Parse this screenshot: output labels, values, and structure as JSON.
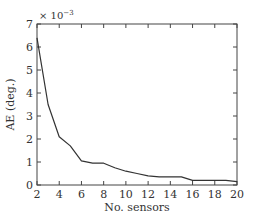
{
  "chart_data": {
    "type": "line",
    "title": "",
    "xlabel": "No. sensors",
    "ylabel": "AE (deg.)",
    "y_scale_label": "× 10",
    "y_scale_exponent": "−3",
    "xlim": [
      2,
      20
    ],
    "ylim": [
      0,
      7
    ],
    "xticks": [
      2,
      4,
      6,
      8,
      10,
      12,
      14,
      16,
      18,
      20
    ],
    "yticks": [
      0,
      1,
      2,
      3,
      4,
      5,
      6,
      7
    ],
    "grid": false,
    "legend": null,
    "series": [
      {
        "name": "AE",
        "color": "#333333",
        "x": [
          2,
          3,
          4,
          5,
          6,
          7,
          8,
          9,
          10,
          11,
          12,
          13,
          14,
          15,
          16,
          17,
          18,
          19,
          20
        ],
        "y": [
          6.4,
          3.5,
          2.1,
          1.7,
          1.05,
          0.95,
          0.95,
          0.75,
          0.6,
          0.5,
          0.4,
          0.35,
          0.35,
          0.35,
          0.2,
          0.2,
          0.2,
          0.2,
          0.15
        ]
      }
    ]
  },
  "layout": {
    "plot_left": 37,
    "plot_right": 237,
    "plot_top": 24,
    "plot_bottom": 185
  }
}
